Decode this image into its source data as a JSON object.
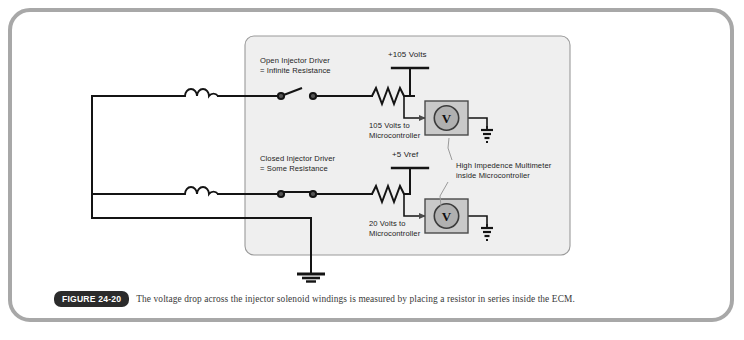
{
  "figure": {
    "badge": "FIGURE 24-20",
    "caption": "The voltage drop across the injector solenoid windings is measured by placing a resistor in series inside the ECM."
  },
  "diagram": {
    "panel_name": "ECM enclosure",
    "labels": {
      "open_driver": "Open Injector Driver\n= Infinite Resistance",
      "closed_driver": "Closed Injector Driver\n= Some Resistance",
      "supply_top": "+105 Volts",
      "supply_bottom": "+5 Vref",
      "signal_top": "105 Volts to\nMicrocontroller",
      "signal_bottom": "20 Volts to\nMicrocontroller",
      "multimeter_note": "High Impedence Multimeter\ninside Microcontroller",
      "meter_symbol": "V"
    },
    "components": [
      {
        "name": "injector-coil-top",
        "type": "inductor"
      },
      {
        "name": "injector-coil-bottom",
        "type": "inductor"
      },
      {
        "name": "switch-open",
        "type": "switch",
        "state": "open"
      },
      {
        "name": "switch-closed",
        "type": "switch",
        "state": "closed"
      },
      {
        "name": "resistor-top",
        "type": "resistor"
      },
      {
        "name": "resistor-bottom",
        "type": "resistor"
      },
      {
        "name": "voltmeter-top",
        "type": "voltmeter"
      },
      {
        "name": "voltmeter-bottom",
        "type": "voltmeter"
      },
      {
        "name": "ground-top",
        "type": "ground"
      },
      {
        "name": "ground-bottom",
        "type": "ground"
      },
      {
        "name": "ground-chassis",
        "type": "ground"
      }
    ],
    "colors": {
      "wire": "#1a1a1a",
      "panel_fill": "#efefef",
      "panel_border": "#9a9a9a",
      "meter_fill": "#b5b5b5",
      "meter_box": "#c9c9c9",
      "frame": "#a8a8a8"
    }
  }
}
